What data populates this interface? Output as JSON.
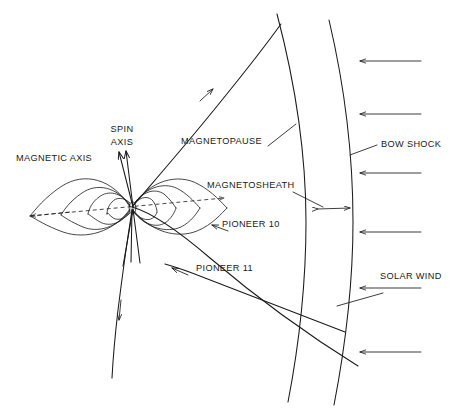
{
  "figure": {
    "background_color": "#ffffff",
    "line_color": "#1a1a1a",
    "width": 461,
    "height": 409
  },
  "labels": {
    "spin_axis_line1": "SPIN",
    "spin_axis_line2": "AXIS",
    "magnetic_axis": "MAGNETIC AXIS",
    "magnetopause": "MAGNETOPAUSE",
    "bow_shock": "BOW SHOCK",
    "magnetosheath": "MAGNETOSHEATH",
    "pioneer_10": "PIONEER 10",
    "pioneer_11": "PIONEER 11",
    "solar_wind": "SOLAR WIND"
  },
  "label_positions": {
    "spin_axis_line1": {
      "x": 122,
      "y": 130
    },
    "spin_axis_line2": {
      "x": 122,
      "y": 143
    },
    "magnetic_axis": {
      "x": 16,
      "y": 159
    },
    "magnetopause": {
      "x": 181,
      "y": 142
    },
    "bow_shock": {
      "x": 381,
      "y": 145
    },
    "magnetosheath": {
      "x": 207,
      "y": 186
    },
    "pioneer_10": {
      "x": 222,
      "y": 225
    },
    "pioneer_11": {
      "x": 196,
      "y": 269
    },
    "solar_wind": {
      "x": 380,
      "y": 277
    }
  },
  "solar_wind_arrows": {
    "count": 6,
    "direction": "left",
    "x_start": 421,
    "x_end": 360,
    "y_values": [
      61,
      114,
      173,
      232,
      288,
      352
    ]
  },
  "boundaries": {
    "magnetopause_curve": "arc from top-left sweeping right and down, inner boundary",
    "bow_shock_curve": "outer arc, right of magnetopause"
  },
  "magnetosheath_span": {
    "from_x": 317,
    "to_x": 351,
    "y": 208
  },
  "trajectories": [
    {
      "name": "PIONEER 10",
      "crosses": [
        "bow shock",
        "magnetopause"
      ]
    },
    {
      "name": "PIONEER 11",
      "crosses": [
        "bow shock",
        "magnetopause"
      ]
    }
  ]
}
